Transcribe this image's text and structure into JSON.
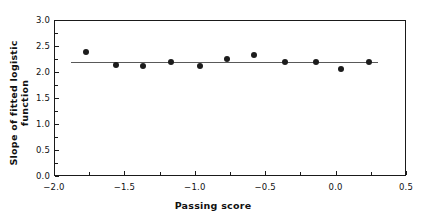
{
  "chart_data": {
    "type": "scatter",
    "title": "",
    "xlabel": "Passing score",
    "ylabel": "Slope of fitted logistic function",
    "xlim": [
      -2.0,
      0.5
    ],
    "ylim": [
      0.0,
      3.0
    ],
    "grid": false,
    "legend": null,
    "xticks": [
      "-2.0",
      "-1.5",
      "-1.0",
      "-0.5",
      "0.0",
      "0.5"
    ],
    "xtick_values": [
      -2.0,
      -1.5,
      -1.0,
      -0.5,
      0.0,
      0.5
    ],
    "xtick_minor_values": [
      -1.75,
      -1.25,
      -0.75,
      -0.25,
      0.25
    ],
    "yticks": [
      "0.0",
      "0.5",
      "1.0",
      "1.5",
      "2.0",
      "2.5",
      "3.0"
    ],
    "ytick_values": [
      0.0,
      0.5,
      1.0,
      1.5,
      2.0,
      2.5,
      3.0
    ],
    "ytick_minor_values": [
      0.25,
      0.75,
      1.25,
      1.75,
      2.25,
      2.75
    ],
    "series": [
      {
        "name": "Slope of fitted logistic function",
        "marker": "filled-circle",
        "color": "#1c1c1c",
        "x": [
          -1.77,
          -1.56,
          -1.37,
          -1.17,
          -0.96,
          -0.77,
          -0.58,
          -0.36,
          -0.14,
          0.04,
          0.24
        ],
        "y": [
          2.38,
          2.13,
          2.12,
          2.2,
          2.11,
          2.25,
          2.32,
          2.19,
          2.19,
          2.06,
          2.19
        ]
      }
    ],
    "fit_line": {
      "name": "regression-line",
      "color": "#595959",
      "x_start": -1.88,
      "x_end": 0.3,
      "y_start": 2.205,
      "y_end": 2.195
    }
  }
}
